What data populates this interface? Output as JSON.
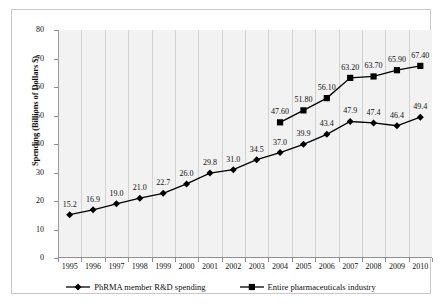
{
  "chart_data": {
    "type": "line",
    "title": "",
    "xlabel": "",
    "ylabel": "Spending (Billions of Dollars $)",
    "ylim": [
      0,
      80
    ],
    "yticks": [
      0,
      10,
      20,
      30,
      40,
      50,
      60,
      70,
      80
    ],
    "grid": "vertical",
    "legend_position": "bottom",
    "categories": [
      "1995",
      "1996",
      "1997",
      "1998",
      "1999",
      "2000",
      "2001",
      "2002",
      "2003",
      "2004",
      "2005",
      "2006",
      "2007",
      "2008",
      "2009",
      "2010"
    ],
    "series": [
      {
        "name": "PhRMA member R&D spending",
        "marker": "diamond",
        "color": "#000000",
        "values": [
          15.2,
          16.9,
          19.0,
          21.0,
          22.7,
          26.0,
          29.8,
          31.0,
          34.5,
          37.0,
          39.9,
          43.4,
          47.9,
          47.4,
          46.4,
          49.4
        ],
        "labels": [
          "15.2",
          "16.9",
          "19.0",
          "21.0",
          "22.7",
          "26.0",
          "29.8",
          "31.0",
          "34.5",
          "37.0",
          "39.9",
          "43.4",
          "47.9",
          "47.4",
          "46.4",
          "49.4"
        ]
      },
      {
        "name": "Entire pharmaceuticals industry",
        "marker": "square",
        "color": "#000000",
        "values": [
          null,
          null,
          null,
          null,
          null,
          null,
          null,
          null,
          null,
          47.6,
          51.8,
          56.1,
          63.2,
          63.7,
          65.9,
          67.4
        ],
        "labels": [
          "",
          "",
          "",
          "",
          "",
          "",
          "",
          "",
          "",
          "47.60",
          "51.80",
          "56.10",
          "63.20",
          "63.70",
          "65.90",
          "67.40"
        ]
      }
    ]
  },
  "legend": {
    "items": [
      {
        "label": "PhRMA member R&D spending",
        "marker": "diamond"
      },
      {
        "label": "Entire pharmaceuticals industry",
        "marker": "square"
      }
    ]
  }
}
